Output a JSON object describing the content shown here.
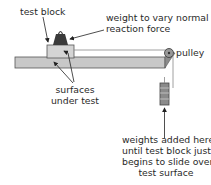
{
  "diagram": {
    "type": "friction-experiment",
    "labels": {
      "test_block": "test block",
      "weight_line1": "weight to vary normal",
      "weight_line2": "reaction force",
      "pulley": "pulley",
      "surfaces_line1": "surfaces",
      "surfaces_line2": "under test",
      "weights_line1": "weights added here",
      "weights_line2": "until test block just",
      "weights_line3": "begins to slide over",
      "weights_line4": "test surface"
    },
    "colors": {
      "plank": "#c8c8c8",
      "block": "#d0d0d0",
      "weight": "#3a3a3a",
      "hanging_weights": "#8a8a8a",
      "line": "#333333"
    }
  }
}
